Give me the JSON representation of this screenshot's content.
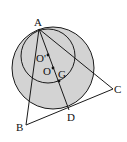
{
  "diagram": {
    "type": "geometry",
    "colors": {
      "fill": "#d3d3d3",
      "stroke": "#1a1a1a",
      "background": "#ffffff"
    },
    "points": {
      "A": {
        "label": "A",
        "x": 39,
        "y": 29
      },
      "B": {
        "label": "B",
        "x": 26,
        "y": 125
      },
      "C": {
        "label": "C",
        "x": 113,
        "y": 89
      },
      "D": {
        "label": "D",
        "x": 69,
        "y": 110
      },
      "O": {
        "label": "O",
        "x": 53,
        "y": 68
      },
      "O1": {
        "label": "O'",
        "x": 48,
        "y": 55
      },
      "G": {
        "label": "G",
        "x": 59,
        "y": 81
      }
    },
    "circles": [
      {
        "name": "large-circle",
        "center": "O",
        "r": 41
      },
      {
        "name": "small-circle",
        "center": "O'",
        "r": 27
      }
    ],
    "segments": [
      "AB",
      "AC",
      "AD",
      "BC"
    ]
  }
}
